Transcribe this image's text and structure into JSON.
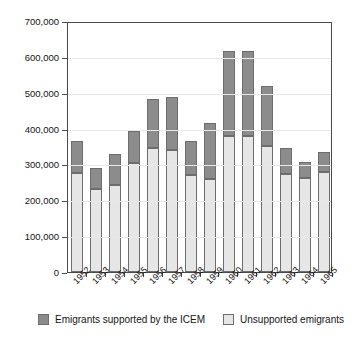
{
  "chart_data": {
    "type": "bar",
    "stacked": true,
    "title": "",
    "subtitle": "",
    "xlabel": "",
    "ylabel": "",
    "ylim": [
      0,
      700000
    ],
    "ytick_values": [
      0,
      100000,
      200000,
      300000,
      400000,
      500000,
      600000,
      700000
    ],
    "ytick_labels": [
      "0",
      "100,000",
      "200,000",
      "300,000",
      "400,000",
      "500,000",
      "600,000",
      "700,000"
    ],
    "grid": true,
    "grid_axis": "y",
    "legend_position": "bottom",
    "categories": [
      "1952",
      "1953",
      "1954",
      "1955",
      "1956",
      "1957",
      "1958",
      "1959",
      "1960",
      "1961",
      "1962",
      "1963",
      "1964",
      "1965"
    ],
    "series": [
      {
        "name": "Unsupported emigrants",
        "color": "#e6e6e6",
        "values": [
          277000,
          231000,
          243000,
          303000,
          345000,
          341000,
          271000,
          259000,
          380000,
          380000,
          352000,
          274000,
          261000,
          278000
        ]
      },
      {
        "name": "Emigrants supported by the ICEM",
        "color": "#8c8c8c",
        "values": [
          89000,
          59000,
          85000,
          91000,
          138000,
          147000,
          95000,
          158000,
          236000,
          236000,
          168000,
          71000,
          45000,
          57000
        ]
      }
    ],
    "totals": [
      366000,
      290000,
      328000,
      394000,
      483000,
      488000,
      366000,
      417000,
      616000,
      616000,
      520000,
      345000,
      306000,
      335000
    ]
  },
  "legend": {
    "items": [
      {
        "label": "Emigrants supported by the ICEM",
        "color": "#8c8c8c"
      },
      {
        "label": "Unsupported emigrants",
        "color": "#e6e6e6"
      }
    ]
  },
  "colors": {
    "supported": "#8c8c8c",
    "unsupported": "#e6e6e6",
    "axis": "#4a4a4a",
    "grid": "#e8e8e8",
    "background": "#ffffff"
  }
}
